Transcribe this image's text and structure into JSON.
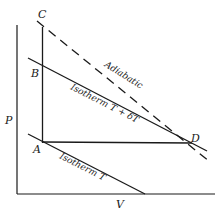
{
  "diagram": {
    "type": "P-V diagram",
    "axes": {
      "y_label": "P",
      "x_label": "V"
    },
    "points": {
      "A": "A",
      "B": "B",
      "C": "C",
      "D": "D"
    },
    "curves": {
      "adiabatic": "Adiabatic",
      "isotherm_high": "Isotherm  T + δT",
      "isotherm_low": "Isotherm  T"
    },
    "colors": {
      "ink": "#1a1a1a",
      "background": "#ffffff"
    }
  }
}
